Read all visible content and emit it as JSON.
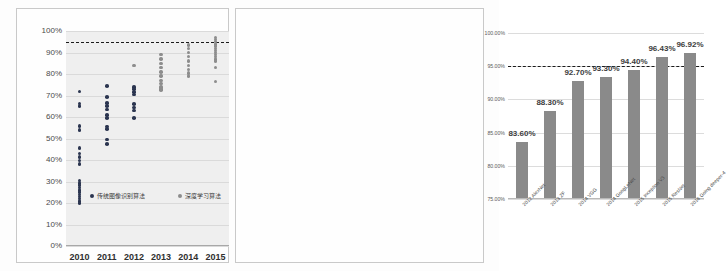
{
  "chart_data": [
    {
      "type": "scatter",
      "panel": "left",
      "title": "",
      "xlabel": "",
      "ylabel": "",
      "categories": [
        "2010",
        "2011",
        "2012",
        "2013",
        "2014",
        "2015"
      ],
      "ylim": [
        0,
        100
      ],
      "ytick_labels": [
        "0%",
        "10%",
        "20%",
        "30%",
        "40%",
        "50%",
        "60%",
        "70%",
        "80%",
        "90%",
        "100%"
      ],
      "ytick_values": [
        0,
        10,
        20,
        30,
        40,
        50,
        60,
        70,
        80,
        90,
        100
      ],
      "grid": true,
      "reference_line": {
        "value": 95,
        "style": "dashed",
        "color": "#1b1b1b",
        "label": ""
      },
      "legend_position": "inside-bottom",
      "legend": [
        {
          "name": "传统图像识别算法",
          "color": "#2b3550"
        },
        {
          "name": "深度学习算法",
          "color": "#8d8d8d"
        }
      ],
      "series": [
        {
          "name": "传统图像识别算法",
          "color": "#2b3550",
          "points": [
            {
              "x": "2010",
              "y": 71.8
            },
            {
              "x": "2010",
              "y": 66.3
            },
            {
              "x": "2010",
              "y": 65.0
            },
            {
              "x": "2010",
              "y": 55.8
            },
            {
              "x": "2010",
              "y": 54.0
            },
            {
              "x": "2010",
              "y": 45.7
            },
            {
              "x": "2010",
              "y": 43.0
            },
            {
              "x": "2010",
              "y": 41.4
            },
            {
              "x": "2010",
              "y": 39.8
            },
            {
              "x": "2010",
              "y": 38.2
            },
            {
              "x": "2010",
              "y": 30.5
            },
            {
              "x": "2010",
              "y": 29.4
            },
            {
              "x": "2010",
              "y": 28.3
            },
            {
              "x": "2010",
              "y": 27.2
            },
            {
              "x": "2010",
              "y": 26.1
            },
            {
              "x": "2010",
              "y": 25.0
            },
            {
              "x": "2010",
              "y": 24.0
            },
            {
              "x": "2010",
              "y": 23.0
            },
            {
              "x": "2010",
              "y": 22.0
            },
            {
              "x": "2010",
              "y": 21.0
            },
            {
              "x": "2010",
              "y": 20.0
            },
            {
              "x": "2011",
              "y": 74.3
            },
            {
              "x": "2011",
              "y": 69.3
            },
            {
              "x": "2011",
              "y": 66.5
            },
            {
              "x": "2011",
              "y": 65.0
            },
            {
              "x": "2011",
              "y": 63.5
            },
            {
              "x": "2011",
              "y": 61.0
            },
            {
              "x": "2011",
              "y": 59.5
            },
            {
              "x": "2011",
              "y": 55.5
            },
            {
              "x": "2011",
              "y": 54.5
            },
            {
              "x": "2011",
              "y": 49.5
            },
            {
              "x": "2011",
              "y": 47.5
            },
            {
              "x": "2012",
              "y": 74.0
            },
            {
              "x": "2012",
              "y": 73.0
            },
            {
              "x": "2012",
              "y": 71.5
            },
            {
              "x": "2012",
              "y": 70.5
            },
            {
              "x": "2012",
              "y": 66.0
            },
            {
              "x": "2012",
              "y": 64.5
            },
            {
              "x": "2012",
              "y": 63.0
            },
            {
              "x": "2012",
              "y": 59.5
            }
          ]
        },
        {
          "name": "深度学习算法",
          "color": "#8d8d8d",
          "points": [
            {
              "x": "2012",
              "y": 84.0
            },
            {
              "x": "2013",
              "y": 89.0
            },
            {
              "x": "2013",
              "y": 87.0
            },
            {
              "x": "2013",
              "y": 85.0
            },
            {
              "x": "2013",
              "y": 83.0
            },
            {
              "x": "2013",
              "y": 81.0
            },
            {
              "x": "2013",
              "y": 79.0
            },
            {
              "x": "2013",
              "y": 77.0
            },
            {
              "x": "2013",
              "y": 75.5
            },
            {
              "x": "2013",
              "y": 74.0
            },
            {
              "x": "2013",
              "y": 73.0
            },
            {
              "x": "2013",
              "y": 72.5
            },
            {
              "x": "2014",
              "y": 93.5
            },
            {
              "x": "2014",
              "y": 92.0
            },
            {
              "x": "2014",
              "y": 90.0
            },
            {
              "x": "2014",
              "y": 88.0
            },
            {
              "x": "2014",
              "y": 86.0
            },
            {
              "x": "2014",
              "y": 84.0
            },
            {
              "x": "2014",
              "y": 82.0
            },
            {
              "x": "2014",
              "y": 80.5
            },
            {
              "x": "2014",
              "y": 79.0
            },
            {
              "x": "2015",
              "y": 97.0
            },
            {
              "x": "2015",
              "y": 96.0
            },
            {
              "x": "2015",
              "y": 95.0
            },
            {
              "x": "2015",
              "y": 94.0
            },
            {
              "x": "2015",
              "y": 93.0
            },
            {
              "x": "2015",
              "y": 92.0
            },
            {
              "x": "2015",
              "y": 91.0
            },
            {
              "x": "2015",
              "y": 90.0
            },
            {
              "x": "2015",
              "y": 89.0
            },
            {
              "x": "2015",
              "y": 88.0
            },
            {
              "x": "2015",
              "y": 87.0
            },
            {
              "x": "2015",
              "y": 86.0
            },
            {
              "x": "2015",
              "y": 83.0
            },
            {
              "x": "2015",
              "y": 76.5
            }
          ]
        }
      ]
    },
    {
      "type": "bar",
      "panel": "right",
      "title": "",
      "xlabel": "",
      "ylabel": "",
      "ylim": [
        75,
        100
      ],
      "ytick_labels": [
        "75.00%",
        "80.00%",
        "85.00%",
        "90.00%",
        "95.00%",
        "100.00%"
      ],
      "ytick_values": [
        75,
        80,
        85,
        90,
        95,
        100
      ],
      "grid": true,
      "bar_color": "#8a8a8a",
      "reference_line": {
        "value": 95,
        "style": "dashed",
        "color": "#1b1b1b"
      },
      "categories": [
        "2012 AlexNet",
        "2013 ZF",
        "2014 VGG",
        "2014 GoogLeNet",
        "2015 Inception V3",
        "2015 ResNet",
        "2016 Going deeper-4"
      ],
      "values": [
        83.6,
        88.3,
        92.7,
        93.3,
        94.4,
        96.43,
        96.92
      ],
      "data_labels": [
        "83.60%",
        "88.30%",
        "92.70%",
        "93.30%",
        "94.40%",
        "96.43%",
        "96.92%"
      ]
    }
  ]
}
